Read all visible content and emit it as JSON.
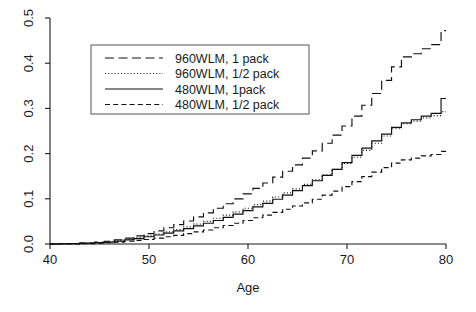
{
  "chart_data": {
    "type": "line",
    "title": "",
    "xlabel": "Age",
    "ylabel": "",
    "xlim": [
      40,
      80
    ],
    "ylim": [
      0.0,
      0.5
    ],
    "xticks": [
      40,
      50,
      60,
      70,
      80
    ],
    "xtick_labels": [
      "40",
      "50",
      "60",
      "70",
      "80"
    ],
    "yticks": [
      0.0,
      0.1,
      0.2,
      0.3,
      0.4,
      0.5
    ],
    "ytick_labels": [
      "0.0",
      "0.1",
      "0.2",
      "0.3",
      "0.4",
      "0.5"
    ],
    "grid": false,
    "legend_position": "upper-left-inside",
    "x": [
      40,
      42,
      44,
      45,
      46,
      47,
      48,
      49,
      50,
      51,
      52,
      53,
      54,
      55,
      56,
      57,
      58,
      59,
      60,
      61,
      62,
      63,
      64,
      65,
      66,
      67,
      68,
      69,
      70,
      71,
      72,
      73,
      74,
      75,
      76,
      77,
      78,
      79,
      80
    ],
    "series": [
      {
        "name": "960WLM, 1 pack",
        "linestyle": "longdash",
        "color": "#111111",
        "values": [
          0.0,
          0.001,
          0.002,
          0.004,
          0.006,
          0.009,
          0.013,
          0.018,
          0.023,
          0.029,
          0.036,
          0.043,
          0.051,
          0.06,
          0.069,
          0.079,
          0.089,
          0.1,
          0.111,
          0.123,
          0.135,
          0.148,
          0.161,
          0.175,
          0.19,
          0.206,
          0.223,
          0.241,
          0.261,
          0.283,
          0.307,
          0.333,
          0.362,
          0.392,
          0.414,
          0.421,
          0.432,
          0.441,
          0.472
        ]
      },
      {
        "name": "960WLM, 1/2 pack",
        "linestyle": "dotted",
        "color": "#111111",
        "values": [
          0.0,
          0.001,
          0.002,
          0.003,
          0.005,
          0.007,
          0.01,
          0.014,
          0.018,
          0.022,
          0.027,
          0.032,
          0.038,
          0.044,
          0.05,
          0.057,
          0.064,
          0.071,
          0.079,
          0.087,
          0.095,
          0.104,
          0.113,
          0.122,
          0.132,
          0.142,
          0.153,
          0.165,
          0.178,
          0.192,
          0.207,
          0.223,
          0.239,
          0.255,
          0.266,
          0.272,
          0.279,
          0.284,
          0.293
        ]
      },
      {
        "name": "480WLM, 1pack",
        "linestyle": "solid",
        "color": "#111111",
        "values": [
          0.0,
          0.001,
          0.002,
          0.003,
          0.004,
          0.006,
          0.009,
          0.012,
          0.016,
          0.02,
          0.024,
          0.029,
          0.034,
          0.04,
          0.046,
          0.052,
          0.059,
          0.066,
          0.074,
          0.082,
          0.09,
          0.099,
          0.108,
          0.118,
          0.129,
          0.14,
          0.152,
          0.165,
          0.18,
          0.196,
          0.212,
          0.228,
          0.243,
          0.258,
          0.268,
          0.275,
          0.283,
          0.289,
          0.322
        ]
      },
      {
        "name": "480WLM, 1/2 pack",
        "linestyle": "dashed",
        "color": "#111111",
        "values": [
          0.0,
          0.0,
          0.001,
          0.002,
          0.003,
          0.004,
          0.006,
          0.008,
          0.01,
          0.013,
          0.016,
          0.019,
          0.023,
          0.027,
          0.031,
          0.036,
          0.041,
          0.046,
          0.052,
          0.058,
          0.064,
          0.07,
          0.077,
          0.084,
          0.091,
          0.099,
          0.108,
          0.117,
          0.127,
          0.138,
          0.149,
          0.159,
          0.169,
          0.179,
          0.186,
          0.19,
          0.195,
          0.198,
          0.205
        ]
      }
    ]
  },
  "legend": {
    "entries": [
      {
        "label": "960WLM, 1 pack"
      },
      {
        "label": "960WLM, 1/2 pack"
      },
      {
        "label": "480WLM, 1pack"
      },
      {
        "label": "480WLM, 1/2 pack"
      }
    ]
  },
  "axes": {
    "x_title": "Age",
    "y_title": ""
  }
}
